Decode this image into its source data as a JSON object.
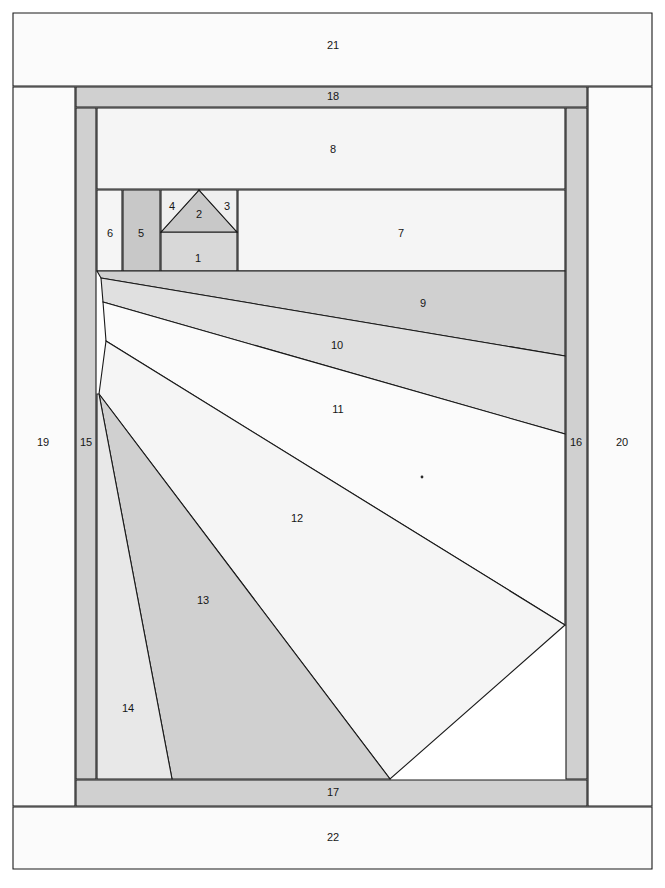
{
  "diagram": {
    "type": "numbered-region-perspective-diagram",
    "canvas": {
      "width": 665,
      "height": 888,
      "background": "#ffffff"
    },
    "palette": {
      "stroke": "#1a1a1a",
      "white": "#fbfbfb",
      "very_light": "#f5f5f5",
      "light": "#efefef",
      "light_gray": "#e8e8e8",
      "mid_light": "#e0e0e0",
      "mid": "#d8d8d8",
      "gray": "#d0d0d0",
      "dark_gray": "#c8c8c8",
      "label_text": "#161616"
    },
    "stroke_width": 1.1,
    "regions": [
      {
        "id": "1",
        "label": "1",
        "fill": "#d8d8d8",
        "label_x": 198,
        "label_y": 259,
        "points": "161,232 237,232 237,271 161,271"
      },
      {
        "id": "2",
        "label": "2",
        "fill": "#c8c8c8",
        "label_x": 199,
        "label_y": 215,
        "points": "161,232 199,190 237,232"
      },
      {
        "id": "3",
        "label": "3",
        "fill": "#efefef",
        "label_x": 227,
        "label_y": 207,
        "points": "199,190 237,190 237,232"
      },
      {
        "id": "4",
        "label": "4",
        "fill": "#efefef",
        "label_x": 172,
        "label_y": 207,
        "points": "161,190 199,190 161,232"
      },
      {
        "id": "5",
        "label": "5",
        "fill": "#c8c8c8",
        "label_x": 141,
        "label_y": 234,
        "points": "123,190 160,190 160,271 123,271"
      },
      {
        "id": "6",
        "label": "6",
        "fill": "#f5f5f5",
        "label_x": 110,
        "label_y": 234,
        "points": "97,190 122,190 122,271 97,271"
      },
      {
        "id": "7",
        "label": "7",
        "fill": "#f5f5f5",
        "label_x": 401,
        "label_y": 234,
        "points": "238,190 565,190 565,271 238,271"
      },
      {
        "id": "8",
        "label": "8",
        "fill": "#f5f5f5",
        "label_x": 333,
        "label_y": 150,
        "points": "97,108 565,108 565,189 97,189"
      },
      {
        "id": "9",
        "label": "9",
        "fill": "#d0d0d0",
        "label_x": 423,
        "label_y": 304,
        "points": "97,271 565,271 565,356 101,278"
      },
      {
        "id": "10",
        "label": "10",
        "fill": "#e0e0e0",
        "label_x": 337,
        "label_y": 346,
        "points": "101,278 565,356 565,434 103,302"
      },
      {
        "id": "11",
        "label": "11",
        "fill": "#fbfbfb",
        "label_x": 338,
        "label_y": 410,
        "points": "103,302 565,434 565,625 106,341"
      },
      {
        "id": "12",
        "label": "12",
        "fill": "#f5f5f5",
        "label_x": 297,
        "label_y": 519,
        "points": "106,341 565,625 390,779 99,394"
      },
      {
        "id": "13",
        "label": "13",
        "fill": "#d0d0d0",
        "label_x": 203,
        "label_y": 601,
        "points": "99,394 390,779 172,779"
      },
      {
        "id": "14",
        "label": "14",
        "fill": "#e8e8e8",
        "label_x": 128,
        "label_y": 709,
        "points": "97,394 99,394 172,779 97,779"
      },
      {
        "id": "15",
        "label": "15",
        "fill": "#d0d0d0",
        "label_x": 86,
        "label_y": 443,
        "points": "76,108 96,108 96,779 76,779"
      },
      {
        "id": "16",
        "label": "16",
        "fill": "#d0d0d0",
        "label_x": 576,
        "label_y": 443,
        "points": "566,108 587,108 587,779 566,779"
      },
      {
        "id": "17",
        "label": "17",
        "fill": "#d0d0d0",
        "label_x": 333,
        "label_y": 793,
        "points": "76,780 587,780 587,806 76,806"
      },
      {
        "id": "18",
        "label": "18",
        "fill": "#d0d0d0",
        "label_x": 333,
        "label_y": 97,
        "points": "76,87 587,87 587,107 76,107"
      },
      {
        "id": "19",
        "label": "19",
        "fill": "#fbfbfb",
        "label_x": 43,
        "label_y": 443,
        "points": "13,87 75,87 75,806 13,806"
      },
      {
        "id": "20",
        "label": "20",
        "fill": "#fbfbfb",
        "label_x": 622,
        "label_y": 443,
        "points": "588,87 652,87 652,806 588,806"
      },
      {
        "id": "21",
        "label": "21",
        "fill": "#fbfbfb",
        "label_x": 333,
        "label_y": 46,
        "points": "13,13 652,13 652,86 13,86"
      },
      {
        "id": "22",
        "label": "22",
        "fill": "#fbfbfb",
        "label_x": 333,
        "label_y": 838,
        "points": "13,807 652,807 652,869 13,869"
      }
    ],
    "marks": [
      {
        "name": "dot-mark",
        "x": 422,
        "y": 477,
        "r": 1.4,
        "fill": "#2a2a2a"
      }
    ]
  }
}
